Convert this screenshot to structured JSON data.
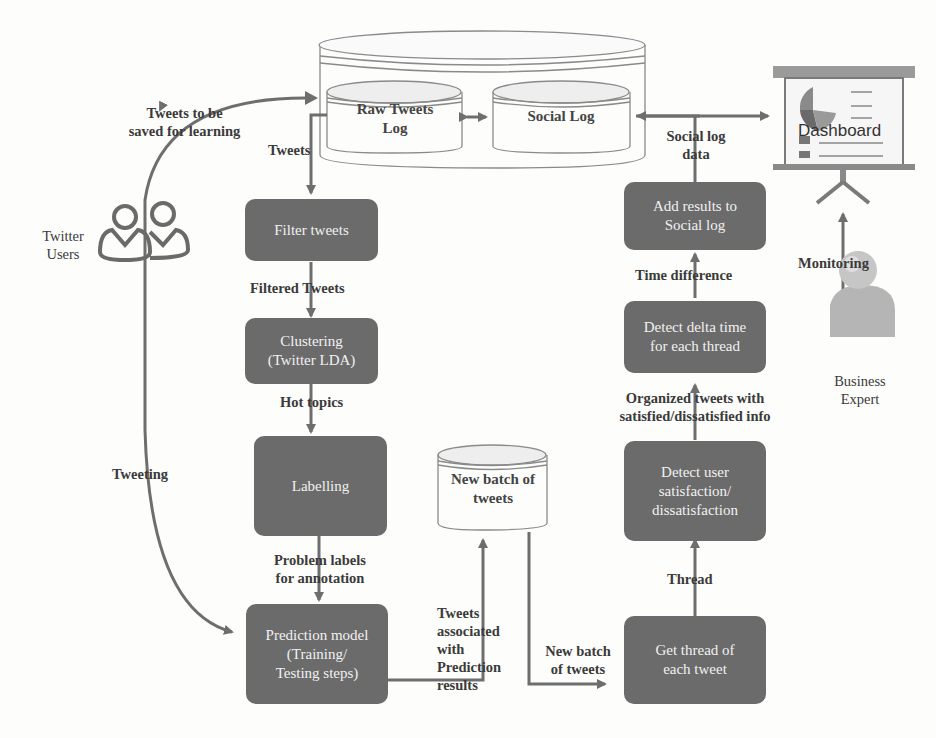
{
  "diagram": {
    "data_stores": {
      "outer_db": "",
      "raw_tweets_log": "Raw Tweets\nLog",
      "raw_tweets_log_l1": "Raw Tweets",
      "raw_tweets_log_l2": "Log",
      "social_log": "Social Log",
      "new_batch": "New batch of\ntweets",
      "new_batch_l1": "New batch of",
      "new_batch_l2": "tweets"
    },
    "process_boxes": {
      "filter_tweets": "Filter tweets",
      "clustering_l1": "Clustering",
      "clustering_l2": "(Twitter LDA)",
      "labelling": "Labelling",
      "prediction_l1": "Prediction model",
      "prediction_l2": "(Training/",
      "prediction_l3": "Testing steps)",
      "get_thread_l1": "Get thread of",
      "get_thread_l2": "each tweet",
      "detect_sat_l1": "Detect user",
      "detect_sat_l2": "satisfaction/",
      "detect_sat_l3": "dissatisfaction",
      "detect_delta_l1": "Detect delta time",
      "detect_delta_l2": "for each thread",
      "add_results_l1": "Add results to",
      "add_results_l2": "Social log"
    },
    "actors": {
      "twitter_users_l1": "Twitter",
      "twitter_users_l2": "Users",
      "business_expert_l1": "Business",
      "business_expert_l2": "Expert",
      "dashboard": "Dashboard"
    },
    "edge_labels": {
      "tweets_saved_l1": "Tweets to be",
      "tweets_saved_l2": "saved for learning",
      "tweets": "Tweets",
      "filtered_tweets": "Filtered Tweets",
      "hot_topics": "Hot topics",
      "tweeting": "Tweeting",
      "problem_labels_l1": "Problem labels",
      "problem_labels_l2": "for annotation",
      "tweets_assoc_l1": "Tweets",
      "tweets_assoc_l2": "associated",
      "tweets_assoc_l3": "with",
      "tweets_assoc_l4": "Prediction",
      "tweets_assoc_l5": "results",
      "new_batch_edge_l1": "New batch",
      "new_batch_edge_l2": "of tweets",
      "thread": "Thread",
      "organized_l1": "Organized tweets with",
      "organized_l2": "satisfied/dissatisfied info",
      "time_difference": "Time difference",
      "social_log_data_l1": "Social log",
      "social_log_data_l2": "data",
      "monitoring": "Monitoring"
    },
    "colors": {
      "box_fill": "#6b6b6b",
      "box_text": "#f1f1f1",
      "line": "#6e6e6e",
      "label_text": "#3a3a3a"
    }
  }
}
